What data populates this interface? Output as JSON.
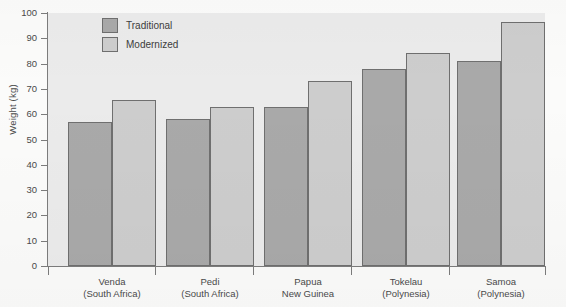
{
  "chart_data": {
    "type": "bar",
    "title": "",
    "xlabel": "",
    "ylabel": "Weight (kg)",
    "ylim": [
      0,
      100
    ],
    "yticks": [
      0,
      10,
      20,
      30,
      40,
      50,
      60,
      70,
      80,
      90,
      100
    ],
    "grid": false,
    "legend_position": "top-left inside plot",
    "categories": [
      "Venda\n(South Africa)",
      "Pedi\n(South Africa)",
      "Papua\nNew Guinea",
      "Tokelau\n(Polynesia)",
      "Samoa\n(Polynesia)"
    ],
    "category_lines": [
      {
        "line1": "Venda",
        "line2": "(South Africa)"
      },
      {
        "line1": "Pedi",
        "line2": "(South Africa)"
      },
      {
        "line1": "Papua",
        "line2": "New Guinea"
      },
      {
        "line1": "Tokelau",
        "line2": "(Polynesia)"
      },
      {
        "line1": "Samoa",
        "line2": "(Polynesia)"
      }
    ],
    "series": [
      {
        "name": "Traditional",
        "color": "#a9a9a9",
        "values": [
          57,
          58,
          63,
          78,
          81
        ]
      },
      {
        "name": "Modernized",
        "color": "#cdcdcd",
        "values": [
          65.5,
          63,
          73,
          84,
          96.5
        ]
      }
    ]
  },
  "legend": {
    "items": [
      {
        "label": "Traditional"
      },
      {
        "label": "Modernized"
      }
    ]
  }
}
